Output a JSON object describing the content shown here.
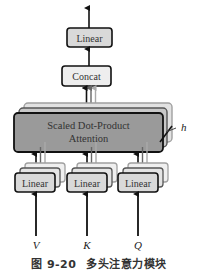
{
  "diagram": {
    "nodes": {
      "output_linear": {
        "label": "Linear"
      },
      "concat": {
        "label": "Concat"
      },
      "attention": {
        "label_line1": "Scaled Dot-Product",
        "label_line2": "Attention"
      },
      "linear_v": {
        "label": "Linear"
      },
      "linear_k": {
        "label": "Linear"
      },
      "linear_q": {
        "label": "Linear"
      }
    },
    "inputs": {
      "v": "V",
      "k": "K",
      "q": "Q"
    },
    "heads_label": "h",
    "colors": {
      "attention_fill": "#9a9a9a",
      "linear_fill": "#d9d9d9",
      "box_stroke": "#111111",
      "back_layer_stroke_1": "#555555",
      "back_layer_stroke_2": "#a0a0a0"
    }
  },
  "caption": {
    "number": "图 9-20",
    "text": "多头注意力模块"
  }
}
